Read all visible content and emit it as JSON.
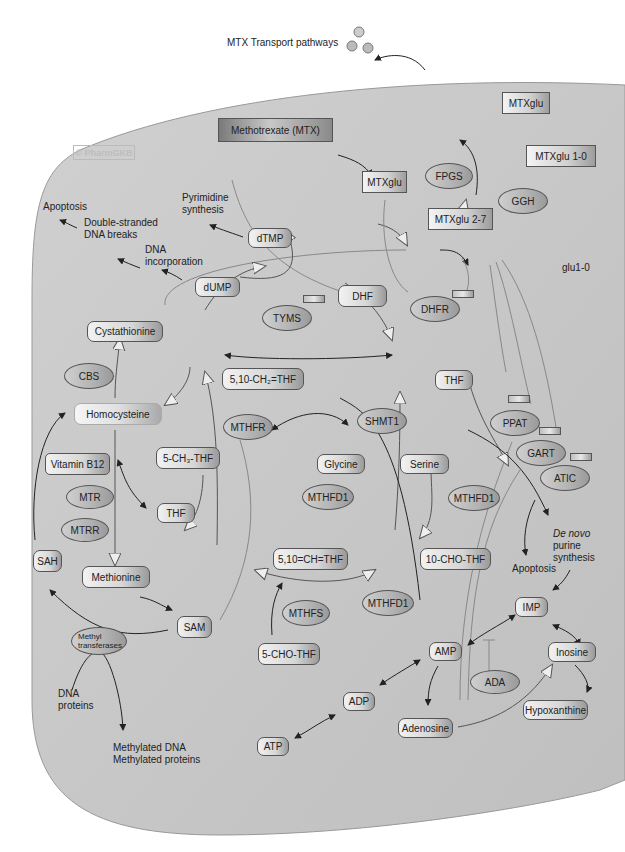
{
  "watermark": "© PharmGKB",
  "colors": {
    "cell_fill": "#c9c9c9",
    "cell_border": "#8a8a8a",
    "line": "#333333",
    "inhibit_line": "#888888"
  },
  "external": {
    "transport_label": "MTX Transport pathways",
    "transport_icon": "transport-molecules-icon"
  },
  "drugs": {
    "mtx": "Methotrexate (MTX)",
    "mtxglu": "MTXglu",
    "mtxglu27": "MTXglu 2-7",
    "mtxglu10": "MTXglu 1-0",
    "mtxglu_out": "MTXglu",
    "glu10": "glu1-0"
  },
  "enzymes": {
    "fpgs": "FPGS",
    "ggh": "GGH",
    "tyms": "TYMS",
    "dhfr": "DHFR",
    "cbs": "CBS",
    "mthfr": "MTHFR",
    "shmt1": "SHMT1",
    "mtr": "MTR",
    "mtrr": "MTRR",
    "mthfd1_a": "MTHFD1",
    "mthfd1_b": "MTHFD1",
    "mthfd1_c": "MTHFD1",
    "mthfs": "MTHFS",
    "ppat": "PPAT",
    "gart": "GART",
    "atic": "ATIC",
    "ada": "ADA",
    "methyltransferases": "Methyl transferases"
  },
  "metabolites": {
    "dtmp": "dTMP",
    "dump": "dUMP",
    "dhf": "DHF",
    "thf": "THF",
    "ch2thf": "5,10-CH₂=THF",
    "ch3thf": "5-CH₃-THF",
    "thf2": "THF",
    "cystathionine": "Cystathionine",
    "homocysteine": "Homocysteine",
    "vitb12": "Vitamin B12",
    "glycine": "Glycine",
    "serine": "Serine",
    "chthf": "5,10=CH=THF",
    "chothf": "10-CHO-THF",
    "chothf5": "5-CHO-THF",
    "sah": "SAH",
    "methionine": "Methionine",
    "sam": "SAM",
    "imp": "IMP",
    "amp": "AMP",
    "adp": "ADP",
    "atp": "ATP",
    "adenosine": "Adenosine",
    "inosine": "Inosine",
    "hypoxanthine": "Hypoxanthine"
  },
  "outcomes": {
    "apoptosis1": "Apoptosis",
    "dsb": [
      "Double-stranded",
      "DNA breaks"
    ],
    "dna_incorp": [
      "DNA",
      "incorporation"
    ],
    "pyrimidine": [
      "Pyrimidine",
      "synthesis"
    ],
    "denovo": [
      "De novo",
      "purine",
      "synthesis"
    ],
    "apoptosis2": "Apoptosis",
    "dna_proteins": [
      "DNA",
      "proteins"
    ],
    "methylated": [
      "Methylated DNA",
      "Methylated proteins"
    ]
  }
}
